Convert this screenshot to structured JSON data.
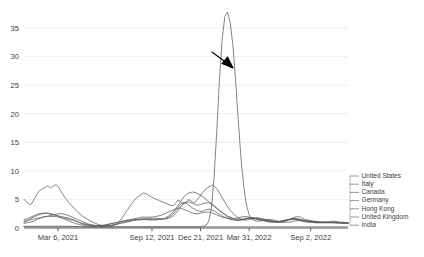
{
  "chart_data": {
    "type": "line",
    "title": "",
    "xlabel": "",
    "ylabel": "",
    "ylim": [
      0,
      38.5
    ],
    "yticks": [
      0,
      5,
      10,
      15,
      20,
      25,
      30,
      35
    ],
    "ytick_labels": [
      "0",
      "5",
      "10",
      "15",
      "20",
      "25",
      "30",
      "35"
    ],
    "xtick_labels": [
      "Mar 6, 2021",
      "Sep 12, 2021",
      "Dec 21, 2021",
      "Mar 31, 2022",
      "Sep 2, 2022"
    ],
    "xtick_positions": [
      0.105,
      0.395,
      0.545,
      0.695,
      0.885
    ],
    "grid": true,
    "legend_position": "right",
    "legend_entries": [
      "United States",
      "Italy",
      "Canada",
      "Germany",
      "Hong Kong",
      "United Kingdom",
      "India"
    ],
    "annotations": [
      {
        "name": "peak-arrow",
        "text": "",
        "points_to_value": 29.5,
        "description": "black arrow pointing down-right at the tall Hong Kong peak"
      }
    ],
    "series": [
      {
        "name": "United States",
        "color": "#5a5a5a",
        "values": [
          5.0,
          4.6,
          4.1,
          4.3,
          5.2,
          6.0,
          6.6,
          6.9,
          7.1,
          7.4,
          7.0,
          7.3,
          7.6,
          7.2,
          6.4,
          5.6,
          5.0,
          4.4,
          3.9,
          3.4,
          2.9,
          2.5,
          2.1,
          1.8,
          1.5,
          1.2,
          1.0,
          0.8,
          0.6,
          0.5,
          0.4,
          0.35,
          0.3,
          0.35,
          0.5,
          0.8,
          1.2,
          1.8,
          2.5,
          3.2,
          3.9,
          4.5,
          5.1,
          5.5,
          5.8,
          6.1,
          6.0,
          5.7,
          5.4,
          5.2,
          5.0,
          4.8,
          4.6,
          4.4,
          4.2,
          4.0,
          3.9,
          4.3,
          4.9,
          4.6,
          4.2,
          4.4,
          5.0,
          4.7,
          4.4,
          4.8,
          5.4,
          6.1,
          6.6,
          7.0,
          7.3,
          7.5,
          7.2,
          6.6,
          5.8,
          5.0,
          4.2,
          3.5,
          2.9,
          2.4,
          2.0,
          1.7,
          1.5,
          1.4,
          1.4,
          1.5,
          1.6,
          1.7,
          1.8,
          1.7,
          1.6,
          1.5,
          1.4,
          1.3,
          1.2,
          1.1,
          1.0,
          1.0,
          1.1,
          1.3,
          1.5,
          1.7,
          1.9,
          2.0,
          1.9,
          1.7,
          1.5,
          1.4,
          1.3,
          1.2,
          1.1,
          1.1,
          1.0,
          1.0,
          1.0,
          1.1,
          1.2,
          1.2,
          1.1,
          1.0,
          1.0,
          0.95,
          0.9
        ]
      },
      {
        "name": "Italy",
        "color": "#5a5a5a",
        "values": [
          1.5,
          1.6,
          1.8,
          2.0,
          2.2,
          2.4,
          2.5,
          2.6,
          2.6,
          2.5,
          2.4,
          2.3,
          2.2,
          2.1,
          2.0,
          1.9,
          1.8,
          1.7,
          1.5,
          1.3,
          1.1,
          0.9,
          0.7,
          0.6,
          0.5,
          0.4,
          0.35,
          0.3,
          0.3,
          0.3,
          0.35,
          0.4,
          0.45,
          0.5,
          0.6,
          0.7,
          0.8,
          0.9,
          1.0,
          1.1,
          1.2,
          1.3,
          1.35,
          1.4,
          1.45,
          1.5,
          1.5,
          1.5,
          1.5,
          1.5,
          1.5,
          1.5,
          1.6,
          1.7,
          1.9,
          2.2,
          2.6,
          3.2,
          3.9,
          4.3,
          4.5,
          4.2,
          3.8,
          3.5,
          3.2,
          3.0,
          2.9,
          3.0,
          3.2,
          3.3,
          3.2,
          3.0,
          2.7,
          2.4,
          2.1,
          1.9,
          1.7,
          1.5,
          1.4,
          1.3,
          1.3,
          1.4,
          1.5,
          1.6,
          1.7,
          1.7,
          1.6,
          1.5,
          1.4,
          1.3,
          1.2,
          1.1,
          1.0,
          1.0,
          1.0,
          1.0,
          1.1,
          1.2,
          1.3,
          1.4,
          1.5,
          1.6,
          1.6,
          1.5,
          1.4,
          1.3,
          1.2,
          1.2,
          1.1,
          1.1,
          1.0,
          1.0,
          1.0,
          1.0,
          1.0,
          1.0,
          1.0,
          1.0,
          0.95,
          0.9,
          0.9,
          0.9
        ]
      },
      {
        "name": "Canada",
        "color": "#5a5a5a",
        "values": [
          0.8,
          0.9,
          1.0,
          1.1,
          1.3,
          1.5,
          1.7,
          1.9,
          2.0,
          2.1,
          2.2,
          2.3,
          2.4,
          2.5,
          2.5,
          2.4,
          2.3,
          2.1,
          1.9,
          1.7,
          1.5,
          1.3,
          1.1,
          0.9,
          0.7,
          0.6,
          0.5,
          0.4,
          0.35,
          0.3,
          0.3,
          0.35,
          0.4,
          0.5,
          0.6,
          0.7,
          0.85,
          1.0,
          1.1,
          1.2,
          1.3,
          1.4,
          1.5,
          1.55,
          1.6,
          1.65,
          1.7,
          1.7,
          1.7,
          1.7,
          1.65,
          1.6,
          1.6,
          1.6,
          1.7,
          1.9,
          2.2,
          2.7,
          3.4,
          4.0,
          4.4,
          4.6,
          4.5,
          4.3,
          4.1,
          4.0,
          4.1,
          4.3,
          4.4,
          4.4,
          4.2,
          3.9,
          3.5,
          3.1,
          2.7,
          2.3,
          2.0,
          1.8,
          1.6,
          1.5,
          1.4,
          1.4,
          1.5,
          1.6,
          1.7,
          1.8,
          1.8,
          1.7,
          1.6,
          1.5,
          1.4,
          1.3,
          1.2,
          1.2,
          1.1,
          1.1,
          1.2,
          1.3,
          1.4,
          1.5,
          1.6,
          1.6,
          1.5,
          1.4,
          1.3,
          1.2,
          1.2,
          1.1,
          1.1,
          1.0,
          1.0,
          1.0,
          1.0,
          1.0,
          1.0,
          0.95,
          0.95,
          0.9,
          0.9,
          0.9,
          0.85,
          0.85
        ]
      },
      {
        "name": "Germany",
        "color": "#5a5a5a",
        "values": [
          1.0,
          1.2,
          1.5,
          1.8,
          2.0,
          2.2,
          2.4,
          2.5,
          2.6,
          2.6,
          2.5,
          2.4,
          2.2,
          2.0,
          1.8,
          1.6,
          1.4,
          1.2,
          1.0,
          0.85,
          0.7,
          0.6,
          0.5,
          0.4,
          0.35,
          0.3,
          0.3,
          0.3,
          0.35,
          0.4,
          0.5,
          0.6,
          0.7,
          0.8,
          0.9,
          1.0,
          1.1,
          1.2,
          1.3,
          1.35,
          1.4,
          1.45,
          1.5,
          1.5,
          1.5,
          1.5,
          1.45,
          1.4,
          1.4,
          1.4,
          1.45,
          1.5,
          1.6,
          1.8,
          2.1,
          2.5,
          3.0,
          3.6,
          4.3,
          5.0,
          5.6,
          6.0,
          6.2,
          6.3,
          6.2,
          6.0,
          5.7,
          5.4,
          5.0,
          4.6,
          4.2,
          3.8,
          3.4,
          3.0,
          2.7,
          2.4,
          2.1,
          1.9,
          1.7,
          1.6,
          1.5,
          1.5,
          1.6,
          1.7,
          1.8,
          1.8,
          1.7,
          1.6,
          1.5,
          1.4,
          1.3,
          1.2,
          1.2,
          1.1,
          1.1,
          1.1,
          1.2,
          1.3,
          1.4,
          1.5,
          1.6,
          1.7,
          1.6,
          1.5,
          1.4,
          1.3,
          1.2,
          1.2,
          1.1,
          1.1,
          1.0,
          1.0,
          1.0,
          1.0,
          1.0,
          1.0,
          1.0,
          0.95,
          0.95,
          0.9,
          0.9,
          0.9
        ]
      },
      {
        "name": "Hong Kong",
        "color": "#5a5a5a",
        "values": [
          0.2,
          0.2,
          0.2,
          0.2,
          0.2,
          0.2,
          0.2,
          0.2,
          0.2,
          0.2,
          0.2,
          0.2,
          0.2,
          0.2,
          0.2,
          0.2,
          0.2,
          0.2,
          0.2,
          0.2,
          0.2,
          0.2,
          0.2,
          0.2,
          0.2,
          0.2,
          0.2,
          0.2,
          0.2,
          0.2,
          0.2,
          0.2,
          0.2,
          0.2,
          0.2,
          0.2,
          0.2,
          0.2,
          0.2,
          0.2,
          0.2,
          0.2,
          0.2,
          0.2,
          0.2,
          0.2,
          0.2,
          0.2,
          0.2,
          0.2,
          0.2,
          0.2,
          0.2,
          0.2,
          0.2,
          0.2,
          0.2,
          0.2,
          0.2,
          0.2,
          0.2,
          0.2,
          0.2,
          0.2,
          0.2,
          0.2,
          0.25,
          0.3,
          0.5,
          1.2,
          3.5,
          9.0,
          17.0,
          26.0,
          33.0,
          37.0,
          37.8,
          36.0,
          32.0,
          26.0,
          19.0,
          12.5,
          7.5,
          4.2,
          2.4,
          1.6,
          1.3,
          1.2,
          1.2,
          1.3,
          1.4,
          1.5,
          1.5,
          1.4,
          1.3,
          1.2,
          1.1,
          1.0,
          1.0,
          1.0,
          1.1,
          1.2,
          1.3,
          1.3,
          1.2,
          1.1,
          1.0,
          1.0,
          0.95,
          0.9,
          0.9,
          0.9,
          0.9,
          0.9,
          0.9,
          0.9,
          0.9,
          0.9,
          0.9,
          0.85,
          0.85,
          0.85
        ]
      },
      {
        "name": "United Kingdom",
        "color": "#5a5a5a",
        "values": [
          1.2,
          1.3,
          1.4,
          1.5,
          1.6,
          1.7,
          1.8,
          1.9,
          2.0,
          2.0,
          2.0,
          2.0,
          2.0,
          1.9,
          1.8,
          1.7,
          1.6,
          1.5,
          1.4,
          1.3,
          1.1,
          0.9,
          0.8,
          0.7,
          0.6,
          0.5,
          0.45,
          0.4,
          0.4,
          0.45,
          0.5,
          0.6,
          0.7,
          0.8,
          0.9,
          1.0,
          1.1,
          1.2,
          1.3,
          1.4,
          1.5,
          1.6,
          1.7,
          1.8,
          1.9,
          1.9,
          1.9,
          1.9,
          1.9,
          2.0,
          2.1,
          2.2,
          2.4,
          2.6,
          2.8,
          3.0,
          3.2,
          3.4,
          3.5,
          3.4,
          3.2,
          3.0,
          2.8,
          2.6,
          2.5,
          2.5,
          2.6,
          2.7,
          2.8,
          2.8,
          2.7,
          2.5,
          2.3,
          2.1,
          1.9,
          1.8,
          1.7,
          1.6,
          1.6,
          1.7,
          1.8,
          1.9,
          2.0,
          2.0,
          1.9,
          1.8,
          1.7,
          1.6,
          1.5,
          1.4,
          1.3,
          1.2,
          1.2,
          1.1,
          1.1,
          1.1,
          1.2,
          1.3,
          1.4,
          1.5,
          1.5,
          1.5,
          1.4,
          1.3,
          1.2,
          1.2,
          1.1,
          1.1,
          1.0,
          1.0,
          1.0,
          1.0,
          1.0,
          1.0,
          1.0,
          0.95,
          0.95,
          0.9,
          0.9,
          0.9,
          0.9,
          0.9
        ]
      },
      {
        "name": "India",
        "color": "#5a5a5a",
        "values": [
          0.3,
          0.3,
          0.3,
          0.3,
          0.3,
          0.3,
          0.3,
          0.3,
          0.3,
          0.3,
          0.3,
          0.3,
          0.3,
          0.3,
          0.3,
          0.3,
          0.3,
          0.3,
          0.25,
          0.25,
          0.25,
          0.25,
          0.2,
          0.2,
          0.2,
          0.2,
          0.2,
          0.2,
          0.2,
          0.2,
          0.2,
          0.2,
          0.2,
          0.2,
          0.2,
          0.2,
          0.2,
          0.2,
          0.2,
          0.2,
          0.2,
          0.2,
          0.2,
          0.2,
          0.2,
          0.2,
          0.2,
          0.2,
          0.2,
          0.2,
          0.2,
          0.2,
          0.2,
          0.2,
          0.2,
          0.2,
          0.2,
          0.2,
          0.2,
          0.2,
          0.2,
          0.2,
          0.2,
          0.2,
          0.2,
          0.2,
          0.2,
          0.2,
          0.2,
          0.2,
          0.2,
          0.2,
          0.2,
          0.2,
          0.2,
          0.2,
          0.2,
          0.2,
          0.2,
          0.2,
          0.2,
          0.2,
          0.2,
          0.2,
          0.2,
          0.2,
          0.2,
          0.2,
          0.2,
          0.2,
          0.2,
          0.2,
          0.2,
          0.2,
          0.2,
          0.2,
          0.2,
          0.2,
          0.2,
          0.2,
          0.2,
          0.2,
          0.2,
          0.2,
          0.2,
          0.2,
          0.2,
          0.2,
          0.2,
          0.2,
          0.2,
          0.2,
          0.2,
          0.2,
          0.2,
          0.2,
          0.2,
          0.2,
          0.2,
          0.2,
          0.2,
          0.2
        ]
      }
    ]
  }
}
